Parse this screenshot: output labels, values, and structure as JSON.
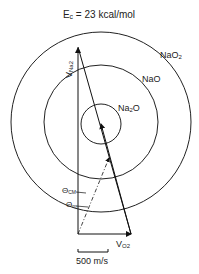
{
  "title": {
    "main": "E",
    "sub": "c",
    "rest": " = 23 kcal/mol"
  },
  "circles": [
    {
      "name": "NaO2",
      "label_main": "NaO",
      "label_sub": "2"
    },
    {
      "name": "NaO",
      "label_main": "NaO",
      "label_sub": ""
    },
    {
      "name": "Na2O",
      "label_main": "Na",
      "label_sub": "2",
      "label_tail": "O"
    }
  ],
  "vectors": {
    "v_na2": {
      "main": "V",
      "sub": "Na2"
    },
    "v_o2": {
      "main": "V",
      "sub": "O2"
    }
  },
  "angles": {
    "theta_cm": {
      "main": "Θ",
      "sub": "CM"
    },
    "theta_m": {
      "main": "Θ",
      "sub": "m"
    }
  },
  "scale_bar": {
    "label": "500 m/s"
  }
}
